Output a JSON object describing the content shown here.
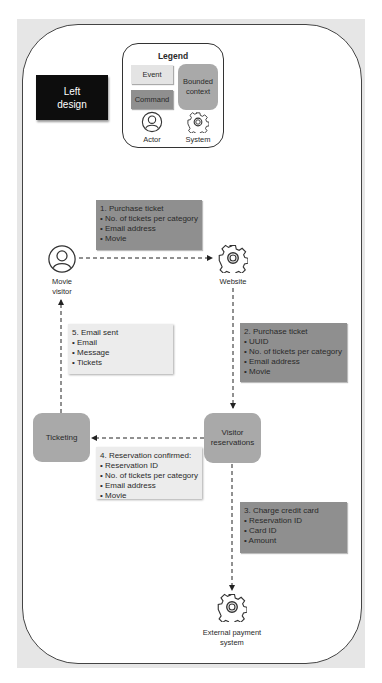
{
  "title_box": {
    "line1": "Left",
    "line2": "design"
  },
  "legend": {
    "title": "Legend",
    "event": "Event",
    "command": "Command",
    "bounded_context_line1": "Bounded",
    "bounded_context_line2": "context",
    "actor": "Actor",
    "system": "System"
  },
  "colors": {
    "command": "#8f8f8f",
    "event": "#ececec",
    "bounded_context": "#a9a9a9",
    "title_box": "#0d0d0d"
  },
  "nodes": {
    "movie_visitor": {
      "line1": "Movie",
      "line2": "visitor",
      "type": "actor"
    },
    "website": {
      "label": "Website",
      "type": "system"
    },
    "ticketing": {
      "label": "Ticketing",
      "type": "bounded-context"
    },
    "visitor_reservations": {
      "line1": "Visitor",
      "line2": "reservations",
      "type": "bounded-context"
    },
    "external_payment": {
      "line1": "External payment",
      "line2": "system",
      "type": "system"
    }
  },
  "messages": {
    "m1": {
      "type": "command",
      "title": "1. Purchase ticket",
      "items": [
        "• No. of tickets per category",
        "• Email address",
        "• Movie"
      ]
    },
    "m2": {
      "type": "command",
      "title": "2. Purchase ticket",
      "items": [
        "• UUID",
        "• No. of tickets per category",
        "• Email address",
        "• Movie"
      ]
    },
    "m3": {
      "type": "command",
      "title": "3. Charge credit card",
      "items": [
        "• Reservation ID",
        "• Card ID",
        "• Amount"
      ]
    },
    "m4": {
      "type": "event",
      "title": "4. Reservation confirmed:",
      "items": [
        "• Reservation ID",
        "• No. of tickets per category",
        "• Email address",
        "• Movie"
      ]
    },
    "m5": {
      "type": "event",
      "title": "5. Email sent",
      "items": [
        "• Email",
        "• Message",
        "• Tickets"
      ]
    }
  }
}
